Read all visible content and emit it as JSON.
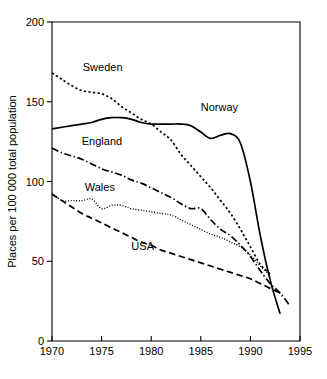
{
  "chart_data": {
    "type": "line",
    "title": "",
    "xlabel": "",
    "ylabel": "Places per 100 000 total population",
    "xlim": [
      1970,
      1995
    ],
    "ylim": [
      0,
      200
    ],
    "xticks": [
      1970,
      1975,
      1980,
      1985,
      1990,
      1995
    ],
    "yticks": [
      0,
      50,
      100,
      150,
      200
    ],
    "xtick_labels": [
      "1970",
      "1975",
      "1980",
      "1985",
      "1990",
      "1995"
    ],
    "ytick_labels": [
      "0",
      "50",
      "100",
      "150",
      "200"
    ],
    "grid": false,
    "legend_position": "inline-annotations",
    "series": [
      {
        "name": "Sweden",
        "linestyle": "dotted",
        "color": "#000000",
        "label_x": 1973.1,
        "label_y": 169,
        "x": [
          1970,
          1971,
          1972,
          1973,
          1974,
          1975,
          1976,
          1977,
          1978,
          1979,
          1980,
          1981,
          1982,
          1983,
          1984,
          1985,
          1986,
          1987,
          1988,
          1989,
          1990,
          1991,
          1992
        ],
        "y": [
          168,
          164,
          160,
          157,
          156,
          155,
          152,
          147,
          143,
          139,
          136,
          131,
          126,
          117,
          110,
          103,
          96,
          88,
          80,
          70,
          59,
          48,
          42
        ]
      },
      {
        "name": "Norway",
        "linestyle": "solid",
        "color": "#000000",
        "label_x": 1985.0,
        "label_y": 144,
        "x": [
          1970,
          1971,
          1972,
          1973,
          1974,
          1975,
          1976,
          1977,
          1978,
          1979,
          1980,
          1981,
          1982,
          1983,
          1984,
          1985,
          1986,
          1987,
          1988,
          1989,
          1990,
          1991,
          1992,
          1993
        ],
        "y": [
          133,
          134,
          135,
          136,
          137,
          139,
          140,
          140,
          139,
          137,
          136,
          136,
          136,
          136,
          135,
          131,
          127,
          129,
          130,
          124,
          100,
          66,
          38,
          17
        ]
      },
      {
        "name": "England",
        "linestyle": "dashdot",
        "color": "#000000",
        "label_x": 1973.0,
        "label_y": 123,
        "x": [
          1970,
          1971,
          1972,
          1973,
          1974,
          1975,
          1976,
          1977,
          1978,
          1979,
          1980,
          1981,
          1982,
          1983,
          1984,
          1985,
          1986,
          1987,
          1988,
          1989,
          1990,
          1991,
          1992,
          1993,
          1994
        ],
        "y": [
          121,
          118,
          116,
          114,
          111,
          108,
          106,
          104,
          101,
          99,
          96,
          93,
          90,
          86,
          83,
          83,
          76,
          70,
          66,
          60,
          53,
          44,
          36,
          30,
          22
        ]
      },
      {
        "name": "Wales",
        "linestyle": "fine-dotted",
        "color": "#000000",
        "label_x": 1973.3,
        "label_y": 94,
        "x": [
          1970,
          1971,
          1972,
          1973,
          1974,
          1975,
          1976,
          1977,
          1978,
          1979,
          1980,
          1981,
          1982,
          1983,
          1984,
          1985,
          1986,
          1987,
          1988,
          1989,
          1990,
          1991,
          1992
        ],
        "y": [
          93,
          88,
          88,
          88,
          89,
          83,
          85,
          85,
          83,
          82,
          81,
          80,
          79,
          76,
          73,
          70,
          67,
          65,
          62,
          59,
          54,
          47,
          41
        ]
      },
      {
        "name": "USA",
        "linestyle": "dashed",
        "color": "#000000",
        "label_x": 1978.0,
        "label_y": 57,
        "x": [
          1970,
          1971,
          1972,
          1973,
          1974,
          1975,
          1976,
          1977,
          1978,
          1979,
          1980,
          1981,
          1982,
          1983,
          1984,
          1985,
          1986,
          1987,
          1988,
          1989,
          1990,
          1991,
          1992,
          1993
        ],
        "y": [
          92,
          88,
          84,
          80,
          77,
          74,
          71,
          68,
          65,
          62,
          60,
          57,
          55,
          53,
          51,
          49,
          47,
          45,
          43,
          41,
          39,
          36,
          33,
          30
        ]
      }
    ]
  }
}
